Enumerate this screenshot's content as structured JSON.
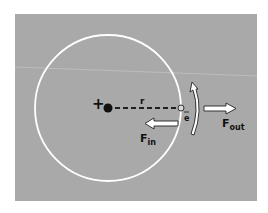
{
  "figure": {
    "colors": {
      "background": "#a8a8a8",
      "orbit": "#ffffff",
      "nucleus": "#111111",
      "arrow_fill": "#ffffff",
      "arrow_stroke": "#222222",
      "text": "#111111"
    },
    "labels": {
      "plus": "+",
      "radius": "r",
      "electron": "e",
      "f_in_main": "F",
      "f_in_sub": "in",
      "f_out_main": "F",
      "f_out_sub": "out"
    }
  }
}
